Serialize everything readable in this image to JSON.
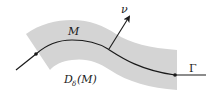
{
  "diagram": {
    "labels": {
      "curve_segment": "M",
      "normal_vector": "ν",
      "full_curve": "Γ",
      "neighborhood_D": "D",
      "neighborhood_sub": "δ",
      "neighborhood_arg": "(M)"
    },
    "colors": {
      "band_fill": "#d4d4d4",
      "curve_stroke": "#1a1a1a",
      "text": "#1a1a1a"
    }
  }
}
